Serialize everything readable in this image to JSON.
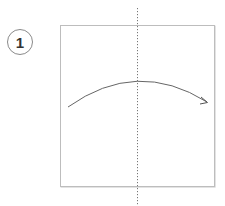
{
  "step": {
    "number": "1"
  },
  "diagram": {
    "type": "origami-fold-instruction",
    "paper": {
      "shape": "square",
      "fill": "#ffffff",
      "stroke": "#bdbdbd"
    },
    "fold_line": {
      "style": "dotted",
      "orientation": "vertical",
      "position": "center",
      "color": "#777777"
    },
    "arrow": {
      "direction": "left-to-right",
      "shape": "arc",
      "color": "#666666"
    }
  }
}
